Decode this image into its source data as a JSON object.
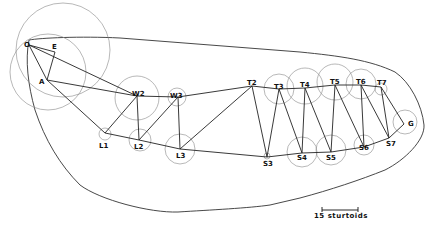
{
  "diagram": {
    "nodes": [
      {
        "id": "O",
        "label": "O",
        "x": 29,
        "y": 45,
        "lx": 24,
        "ly": 47,
        "r": 47,
        "cx": 63,
        "cy": 50
      },
      {
        "id": "E",
        "label": "E",
        "x": 55,
        "y": 52,
        "lx": 52,
        "ly": 49,
        "r": 0,
        "cx": 55,
        "cy": 52
      },
      {
        "id": "A",
        "label": "A",
        "x": 47,
        "y": 80,
        "lx": 39,
        "ly": 84,
        "r": 38,
        "cx": 48,
        "cy": 72
      },
      {
        "id": "W2",
        "label": "W2",
        "x": 137,
        "y": 96,
        "lx": 132,
        "ly": 96,
        "r": 22,
        "cx": 137,
        "cy": 98
      },
      {
        "id": "W3",
        "label": "W3",
        "x": 178,
        "y": 97,
        "lx": 170,
        "ly": 98,
        "r": 9,
        "cx": 177,
        "cy": 97
      },
      {
        "id": "L1",
        "label": "L1",
        "x": 105,
        "y": 133,
        "lx": 99,
        "ly": 148,
        "r": 6,
        "cx": 105,
        "cy": 134
      },
      {
        "id": "L2",
        "label": "L2",
        "x": 139,
        "y": 140,
        "lx": 134,
        "ly": 149,
        "r": 11,
        "cx": 140,
        "cy": 140
      },
      {
        "id": "L3",
        "label": "L3",
        "x": 180,
        "y": 149,
        "lx": 176,
        "ly": 158,
        "r": 15,
        "cx": 180,
        "cy": 149
      },
      {
        "id": "T2",
        "label": "T2",
        "x": 252,
        "y": 86,
        "lx": 247,
        "ly": 85,
        "r": 0,
        "cx": 252,
        "cy": 86
      },
      {
        "id": "T3",
        "label": "T3",
        "x": 279,
        "y": 89,
        "lx": 274,
        "ly": 89,
        "r": 15,
        "cx": 279,
        "cy": 89
      },
      {
        "id": "T4",
        "label": "T4",
        "x": 305,
        "y": 88,
        "lx": 300,
        "ly": 87,
        "r": 18,
        "cx": 305,
        "cy": 86
      },
      {
        "id": "T5",
        "label": "T5",
        "x": 335,
        "y": 85,
        "lx": 330,
        "ly": 84,
        "r": 18,
        "cx": 335,
        "cy": 82
      },
      {
        "id": "T6",
        "label": "T6",
        "x": 361,
        "y": 85,
        "lx": 356,
        "ly": 84,
        "r": 15,
        "cx": 361,
        "cy": 84
      },
      {
        "id": "T7",
        "label": "T7",
        "x": 381,
        "y": 87,
        "lx": 377,
        "ly": 85,
        "r": 6,
        "cx": 381,
        "cy": 89
      },
      {
        "id": "S3",
        "label": "S3",
        "x": 267,
        "y": 157,
        "lx": 263,
        "ly": 166,
        "r": 3,
        "cx": 267,
        "cy": 156
      },
      {
        "id": "S4",
        "label": "S4",
        "x": 302,
        "y": 153,
        "lx": 297,
        "ly": 160,
        "r": 15,
        "cx": 302,
        "cy": 152
      },
      {
        "id": "S5",
        "label": "S5",
        "x": 331,
        "y": 152,
        "lx": 326,
        "ly": 160,
        "r": 15,
        "cx": 331,
        "cy": 150
      },
      {
        "id": "S6",
        "label": "S6",
        "x": 364,
        "y": 147,
        "lx": 359,
        "ly": 150,
        "r": 10,
        "cx": 364,
        "cy": 145
      },
      {
        "id": "S7",
        "label": "S7",
        "x": 389,
        "y": 138,
        "lx": 386,
        "ly": 146,
        "r": 0,
        "cx": 389,
        "cy": 138
      },
      {
        "id": "G",
        "label": "G",
        "x": 404,
        "y": 124,
        "lx": 408,
        "ly": 126,
        "r": 12,
        "cx": 405,
        "cy": 122
      }
    ],
    "edges": [
      [
        "O",
        "E"
      ],
      [
        "O",
        "A"
      ],
      [
        "E",
        "A"
      ],
      [
        "O",
        "W2"
      ],
      [
        "A",
        "W2"
      ],
      [
        "A",
        "L1"
      ],
      [
        "W2",
        "L1"
      ],
      [
        "W2",
        "L2"
      ],
      [
        "W2",
        "W3"
      ],
      [
        "L2",
        "W3"
      ],
      [
        "W3",
        "L3"
      ],
      [
        "W3",
        "T2"
      ],
      [
        "L1",
        "L2"
      ],
      [
        "L2",
        "L3"
      ],
      [
        "L3",
        "S3"
      ],
      [
        "L3",
        "T2"
      ],
      [
        "T2",
        "S3"
      ],
      [
        "T2",
        "T3"
      ],
      [
        "T3",
        "S3"
      ],
      [
        "T3",
        "S4"
      ],
      [
        "T3",
        "T4"
      ],
      [
        "T4",
        "S4"
      ],
      [
        "T4",
        "S5"
      ],
      [
        "T4",
        "T5"
      ],
      [
        "T5",
        "S5"
      ],
      [
        "T5",
        "S6"
      ],
      [
        "T5",
        "T6"
      ],
      [
        "T6",
        "S6"
      ],
      [
        "T6",
        "S7"
      ],
      [
        "T6",
        "T7"
      ],
      [
        "T7",
        "S7"
      ],
      [
        "T7",
        "G"
      ],
      [
        "S3",
        "S4"
      ],
      [
        "S4",
        "S5"
      ],
      [
        "S5",
        "S6"
      ],
      [
        "S6",
        "S7"
      ],
      [
        "S7",
        "G"
      ]
    ],
    "boundary_path": "M 29 40 C 40 38, 80 36, 120 38 L 300 52 C 340 56, 370 60, 395 72 C 410 82, 422 105, 424 125 C 425 140, 405 160, 385 170 C 360 180, 330 190, 300 198 L 270 205 C 250 208, 210 210, 178 212 C 150 213, 100 200, 80 185 C 60 165, 45 140, 35 110 C 28 85, 25 60, 29 40 Z",
    "scale_bar": {
      "label_number": "15",
      "label_unit": "sturtoids",
      "x1": 322,
      "x2": 358,
      "y": 210
    }
  }
}
